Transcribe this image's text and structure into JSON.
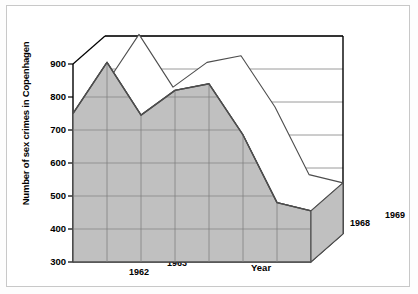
{
  "chart_data": {
    "type": "area",
    "title": "",
    "xlabel": "Year",
    "ylabel": "Number of sex crimes in Copenhagen",
    "categories": [
      "1962",
      "1963",
      "1964",
      "1965",
      "1966",
      "1967",
      "1968",
      "1969"
    ],
    "values": [
      750,
      905,
      745,
      820,
      840,
      685,
      480,
      455
    ],
    "ylim": [
      300,
      900
    ],
    "yticks": [
      "300",
      "400",
      "500",
      "600",
      "700",
      "800",
      "900"
    ],
    "ytick_values": [
      300,
      400,
      500,
      600,
      700,
      800,
      900
    ],
    "grid": true,
    "legend": "none",
    "style": "3d-ribbon-area",
    "colors": {
      "area_fill": "#c0c0c0",
      "area_stroke": "#4d4d4d",
      "ribbon_top": "#ffffff",
      "axis": "#000000",
      "gridline": "#808080",
      "frame": "#c8c8c8",
      "background": "#ffffff"
    }
  },
  "axis": {
    "y_title": "Number of sex crimes in Copenhagen",
    "x_title": "Year",
    "y_ticks": [
      {
        "label": "900"
      },
      {
        "label": "800"
      },
      {
        "label": "700"
      },
      {
        "label": "600"
      },
      {
        "label": "500"
      },
      {
        "label": "400"
      },
      {
        "label": "300"
      }
    ],
    "x_ticks": [
      {
        "label": "1962"
      },
      {
        "label": "1963"
      },
      {
        "label": "1964"
      },
      {
        "label": "1965"
      },
      {
        "label": "1966"
      },
      {
        "label": "1967"
      },
      {
        "label": "1968"
      },
      {
        "label": "1969"
      }
    ]
  }
}
